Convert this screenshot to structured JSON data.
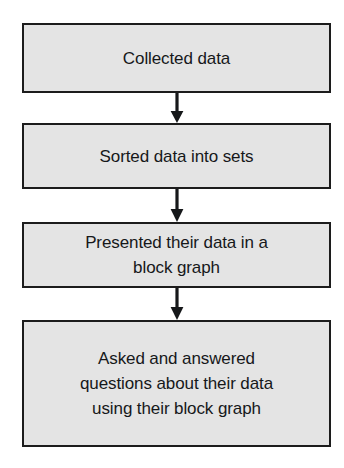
{
  "diagram": {
    "type": "flowchart",
    "orientation": "vertical-top-to-bottom",
    "background_color": "#ffffff",
    "node_fill_color": "#e4e4e4",
    "node_border_color": "#1c1c1c",
    "text_color": "#16181a",
    "arrow_color": "#16181a",
    "nodes": [
      {
        "id": "node-1",
        "label": "Collected data",
        "lines": 1
      },
      {
        "id": "node-2",
        "label": "Sorted data into sets",
        "lines": 1
      },
      {
        "id": "node-3",
        "label": "Presented their data in a\nblock graph",
        "lines": 2
      },
      {
        "id": "node-4",
        "label": "Asked and answered\nquestions about their data\nusing their block graph",
        "lines": 3
      }
    ],
    "connectors": [
      {
        "id": "connector-1",
        "from": "node-1",
        "to": "node-2",
        "icon": "arrow-down-icon"
      },
      {
        "id": "connector-2",
        "from": "node-2",
        "to": "node-3",
        "icon": "arrow-down-icon"
      },
      {
        "id": "connector-3",
        "from": "node-3",
        "to": "node-4",
        "icon": "arrow-down-icon"
      }
    ]
  }
}
